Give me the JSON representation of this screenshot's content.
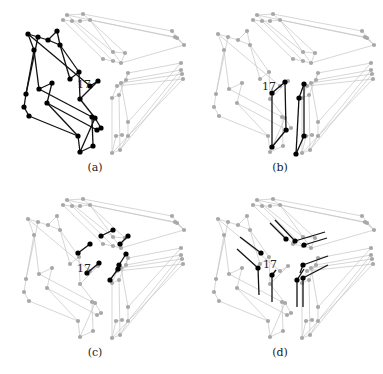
{
  "figure": {
    "width": 383,
    "height": 374,
    "colors": {
      "background": "#ffffff",
      "faded_edge": "#c4c4c4",
      "faded_node": "#a8a8a8",
      "highlight_edge": "#111111",
      "highlight_node": "#000000",
      "text": "#222222"
    },
    "node_label": "17",
    "panels": [
      {
        "id": "a",
        "caption": "(a)",
        "offset": [
          0,
          0
        ],
        "caption_pos": [
          95,
          168
        ],
        "label_pos": [
          77,
          88
        ],
        "highlight_mode": "left_block"
      },
      {
        "id": "b",
        "caption": "(b)",
        "offset": [
          190,
          0
        ],
        "caption_pos": [
          280,
          168
        ],
        "label_pos": [
          262,
          90
        ],
        "highlight_mode": "center_columns"
      },
      {
        "id": "c",
        "caption": "(c)",
        "offset": [
          0,
          185
        ],
        "caption_pos": [
          95,
          353
        ],
        "label_pos": [
          77,
          272
        ],
        "highlight_mode": "short_links"
      },
      {
        "id": "d",
        "caption": "(d)",
        "offset": [
          190,
          185
        ],
        "caption_pos": [
          280,
          353
        ],
        "label_pos": [
          263,
          268
        ],
        "highlight_mode": "corner_stubs"
      }
    ]
  },
  "geometry": {
    "left_block": {
      "nodes": [
        [
          28,
          34
        ],
        [
          38,
          37
        ],
        [
          48,
          40
        ],
        [
          57,
          31
        ],
        [
          34,
          50
        ],
        [
          60,
          45
        ],
        [
          26,
          94
        ],
        [
          39,
          89
        ],
        [
          52,
          83
        ],
        [
          70,
          79
        ],
        [
          24,
          107
        ],
        [
          29,
          116
        ],
        [
          47,
          103
        ],
        [
          79,
          72
        ],
        [
          80,
          99
        ],
        [
          95,
          118
        ],
        [
          78,
          136
        ],
        [
          80,
          152
        ],
        [
          92,
          117
        ],
        [
          93,
          146
        ],
        [
          97,
          130
        ],
        [
          101,
          128
        ],
        [
          90,
          86
        ],
        [
          98,
          81
        ]
      ],
      "edges": [
        [
          0,
          1
        ],
        [
          1,
          2
        ],
        [
          2,
          3
        ],
        [
          0,
          4
        ],
        [
          4,
          6
        ],
        [
          1,
          6
        ],
        [
          3,
          5
        ],
        [
          5,
          9
        ],
        [
          4,
          7
        ],
        [
          6,
          10
        ],
        [
          10,
          11
        ],
        [
          7,
          8
        ],
        [
          8,
          12
        ],
        [
          9,
          13
        ],
        [
          13,
          14
        ],
        [
          2,
          5
        ],
        [
          11,
          16
        ],
        [
          12,
          16
        ],
        [
          16,
          17
        ],
        [
          14,
          15
        ],
        [
          15,
          17
        ],
        [
          5,
          13
        ],
        [
          0,
          22
        ],
        [
          22,
          23
        ],
        [
          23,
          14
        ],
        [
          7,
          18
        ],
        [
          18,
          19
        ],
        [
          19,
          17
        ],
        [
          12,
          20
        ],
        [
          20,
          21
        ],
        [
          21,
          15
        ]
      ]
    },
    "upper_right": {
      "nodes": [
        [
          67,
          15
        ],
        [
          83,
          14
        ],
        [
          63,
          20
        ],
        [
          72,
          21
        ],
        [
          80,
          21
        ],
        [
          90,
          20
        ],
        [
          172,
          31
        ],
        [
          175,
          37
        ],
        [
          177,
          38
        ],
        [
          184,
          45
        ],
        [
          113,
          52
        ],
        [
          125,
          53
        ],
        [
          103,
          59
        ],
        [
          113,
          61
        ],
        [
          121,
          63
        ]
      ],
      "edges": [
        [
          0,
          1
        ],
        [
          2,
          3
        ],
        [
          3,
          4
        ],
        [
          4,
          5
        ],
        [
          1,
          6
        ],
        [
          5,
          7
        ],
        [
          0,
          8
        ],
        [
          6,
          9
        ],
        [
          7,
          9
        ],
        [
          8,
          9
        ],
        [
          0,
          10
        ],
        [
          1,
          11
        ],
        [
          2,
          12
        ],
        [
          3,
          13
        ],
        [
          5,
          14
        ],
        [
          10,
          11
        ],
        [
          12,
          13
        ],
        [
          13,
          14
        ],
        [
          11,
          14
        ],
        [
          14,
          9
        ]
      ]
    },
    "lower_right": {
      "nodes": [
        [
          128,
          73
        ],
        [
          126,
          80
        ],
        [
          121,
          83
        ],
        [
          117,
          86
        ],
        [
          112,
          98
        ],
        [
          119,
          95
        ],
        [
          181,
          63
        ],
        [
          181,
          70
        ],
        [
          182,
          74
        ],
        [
          183,
          79
        ],
        [
          112,
          153
        ],
        [
          120,
          150
        ],
        [
          128,
          122
        ],
        [
          128,
          136
        ],
        [
          122,
          135
        ],
        [
          116,
          136
        ]
      ],
      "edges": [
        [
          0,
          6
        ],
        [
          1,
          7
        ],
        [
          2,
          8
        ],
        [
          3,
          9
        ],
        [
          0,
          1
        ],
        [
          1,
          2
        ],
        [
          2,
          3
        ],
        [
          3,
          4
        ],
        [
          4,
          5
        ],
        [
          5,
          0
        ],
        [
          4,
          10
        ],
        [
          5,
          11
        ],
        [
          2,
          12
        ],
        [
          12,
          13
        ],
        [
          13,
          11
        ],
        [
          11,
          10
        ],
        [
          14,
          15
        ],
        [
          15,
          10
        ],
        [
          10,
          9
        ],
        [
          11,
          8
        ],
        [
          13,
          7
        ],
        [
          12,
          6
        ]
      ]
    },
    "highlights": {
      "center_b": {
        "nodes": [
          [
            82,
            93
          ],
          [
            95,
            82
          ],
          [
            82,
            147
          ],
          [
            96,
            130
          ],
          [
            109,
            98
          ],
          [
            114,
            84
          ],
          [
            106,
            154
          ],
          [
            114,
            136
          ]
        ],
        "edges": [
          [
            0,
            1
          ],
          [
            0,
            2
          ],
          [
            1,
            3
          ],
          [
            2,
            3
          ],
          [
            4,
            5
          ],
          [
            4,
            6
          ],
          [
            5,
            7
          ],
          [
            6,
            7
          ]
        ]
      },
      "links_c": {
        "nodes": [
          [
            101,
            51
          ],
          [
            113,
            45
          ],
          [
            78,
            68
          ],
          [
            90,
            59
          ],
          [
            120,
            59
          ],
          [
            128,
            51
          ],
          [
            87,
            88
          ],
          [
            99,
            78
          ],
          [
            110,
            95
          ],
          [
            118,
            84
          ],
          [
            119,
            80
          ],
          [
            126,
            69
          ]
        ],
        "edges": [
          [
            0,
            1
          ],
          [
            2,
            3
          ],
          [
            4,
            5
          ],
          [
            6,
            7
          ],
          [
            8,
            9
          ],
          [
            10,
            11
          ]
        ]
      },
      "stubs_d": {
        "nodes": [
          [
            96,
            54
          ],
          [
            105,
            56
          ],
          [
            114,
            60
          ],
          [
            71,
            68
          ],
          [
            68,
            83
          ],
          [
            82,
            90
          ],
          [
            113,
            80
          ],
          [
            107,
            95
          ],
          [
            113,
            93
          ]
        ],
        "segments": [
          [
            [
              96,
              54
            ],
            [
              80,
              38
            ]
          ],
          [
            [
              105,
              56
            ],
            [
              85,
              35
            ]
          ],
          [
            [
              105,
              56
            ],
            [
              135,
              47
            ]
          ],
          [
            [
              114,
              60
            ],
            [
              137,
              53
            ]
          ],
          [
            [
              71,
              68
            ],
            [
              50,
              52
            ]
          ],
          [
            [
              68,
              83
            ],
            [
              47,
              64
            ]
          ],
          [
            [
              68,
              83
            ],
            [
              69,
              110
            ]
          ],
          [
            [
              82,
              90
            ],
            [
              82,
              117
            ]
          ],
          [
            [
              82,
              90
            ],
            [
              86,
              85
            ]
          ],
          [
            [
              113,
              80
            ],
            [
              138,
              71
            ]
          ],
          [
            [
              107,
              95
            ],
            [
              107,
              122
            ]
          ],
          [
            [
              113,
              93
            ],
            [
              113,
              122
            ]
          ],
          [
            [
              113,
              93
            ],
            [
              138,
              80
            ]
          ],
          [
            [
              107,
              95
            ],
            [
              114,
              84
            ]
          ],
          [
            [
              113,
              80
            ],
            [
              110,
              88
            ]
          ]
        ]
      }
    }
  }
}
